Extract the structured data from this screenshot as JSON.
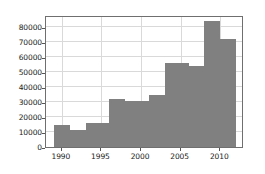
{
  "chart_data": {
    "type": "bar",
    "title": "",
    "xlabel": "",
    "ylabel": "",
    "grid": true,
    "legend": null,
    "bar_color": "#808080",
    "edge_color": "#808080",
    "axis_color": "#6f6f6f",
    "grid_color": "#d9d9d9",
    "background": "#ffffff",
    "xlim": [
      1988,
      2013
    ],
    "ylim": [
      0,
      88000
    ],
    "xticks": [
      1990,
      1995,
      2000,
      2005,
      2010
    ],
    "xtick_labels": [
      "1990",
      "1995",
      "2000",
      "2005",
      "2010"
    ],
    "yticks": [
      0,
      10000,
      20000,
      30000,
      40000,
      50000,
      60000,
      70000,
      80000
    ],
    "ytick_labels": [
      "0",
      "10000",
      "20000",
      "30000",
      "40000",
      "50000",
      "60000",
      "70000",
      "80000"
    ],
    "bins": [
      {
        "x0": 1989,
        "x1": 1991,
        "value": 14700
      },
      {
        "x0": 1991,
        "x1": 1993,
        "value": 11600
      },
      {
        "x0": 1993,
        "x1": 1996,
        "value": 16200
      },
      {
        "x0": 1996,
        "x1": 1998,
        "value": 32000
      },
      {
        "x0": 1998,
        "x1": 2001,
        "value": 30600
      },
      {
        "x0": 2001,
        "x1": 2003,
        "value": 34800
      },
      {
        "x0": 2003,
        "x1": 2006,
        "value": 55700
      },
      {
        "x0": 2006,
        "x1": 2008,
        "value": 54000
      },
      {
        "x0": 2008,
        "x1": 2010,
        "value": 83800
      },
      {
        "x0": 2010,
        "x1": 2012,
        "value": 72000
      }
    ]
  }
}
